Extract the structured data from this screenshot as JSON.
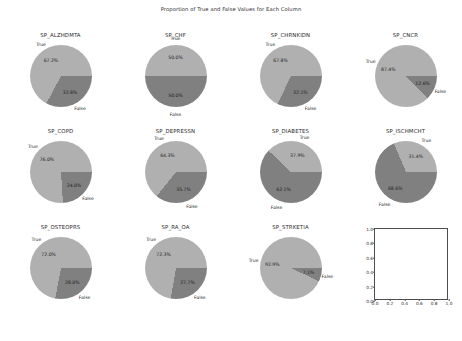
{
  "figure": {
    "title": "Proportion of True and False Values for Each Column",
    "label_true": "True",
    "label_false": "False"
  },
  "colors": {
    "true_slice": "#b0b0b0",
    "false_slice": "#808080",
    "text": "#1f1f1f",
    "axes_line": "#4d4d4d",
    "background": "#ffffff"
  },
  "empty_axes": {
    "xticks": [
      "0.0",
      "0.2",
      "0.4",
      "0.6",
      "0.8",
      "1.0"
    ],
    "yticks": [
      "0.0",
      "0.2",
      "0.4",
      "0.6",
      "0.8",
      "1.0"
    ],
    "xlim": [
      0,
      1
    ],
    "ylim": [
      0,
      1
    ]
  },
  "chart_data": {
    "type": "pie",
    "title": "Proportion of True and False Values for Each Column",
    "legend_position": "outside-labels",
    "grid": false,
    "categories": [
      "True",
      "False"
    ],
    "panels": [
      {
        "title": "SP_ALZHDMTA",
        "values": [
          67.2,
          32.8
        ],
        "labels": [
          "True",
          "False"
        ],
        "pct_labels": [
          "67.2%",
          "32.8%"
        ]
      },
      {
        "title": "SP_CHF",
        "values": [
          50.0,
          50.0
        ],
        "labels": [
          "True",
          "False"
        ],
        "pct_labels": [
          "50.0%",
          "50.0%"
        ]
      },
      {
        "title": "SP_CHRNKIDN",
        "values": [
          67.8,
          32.1
        ],
        "labels": [
          "True",
          "False"
        ],
        "pct_labels": [
          "67.8%",
          "32.1%"
        ]
      },
      {
        "title": "SP_CNCR",
        "values": [
          87.4,
          12.6
        ],
        "labels": [
          "True",
          "False"
        ],
        "pct_labels": [
          "87.4%",
          "12.6%"
        ]
      },
      {
        "title": "SP_COPD",
        "values": [
          76.0,
          24.0
        ],
        "labels": [
          "True",
          "False"
        ],
        "pct_labels": [
          "76.0%",
          "24.0%"
        ]
      },
      {
        "title": "SP_DEPRESSN",
        "values": [
          64.3,
          35.7
        ],
        "labels": [
          "True",
          "False"
        ],
        "pct_labels": [
          "64.3%",
          "35.7%"
        ]
      },
      {
        "title": "SP_DIABETES",
        "values": [
          37.9,
          62.1
        ],
        "labels": [
          "True",
          "False"
        ],
        "pct_labels": [
          "37.9%",
          "62.1%"
        ]
      },
      {
        "title": "SP_ISCHMCHT",
        "values": [
          31.4,
          68.6
        ],
        "labels": [
          "True",
          "False"
        ],
        "pct_labels": [
          "31.4%",
          "68.6%"
        ]
      },
      {
        "title": "SP_OSTEOPRS",
        "values": [
          72.0,
          28.0
        ],
        "labels": [
          "True",
          "False"
        ],
        "pct_labels": [
          "72.0%",
          "28.0%"
        ]
      },
      {
        "title": "SP_RA_OA",
        "values": [
          72.3,
          27.7
        ],
        "labels": [
          "True",
          "False"
        ],
        "pct_labels": [
          "72.3%",
          "27.7%"
        ]
      },
      {
        "title": "SP_STRKETIA",
        "values": [
          92.9,
          7.1
        ],
        "labels": [
          "True",
          "False"
        ],
        "pct_labels": [
          "92.9%",
          "7.1%"
        ]
      }
    ]
  }
}
